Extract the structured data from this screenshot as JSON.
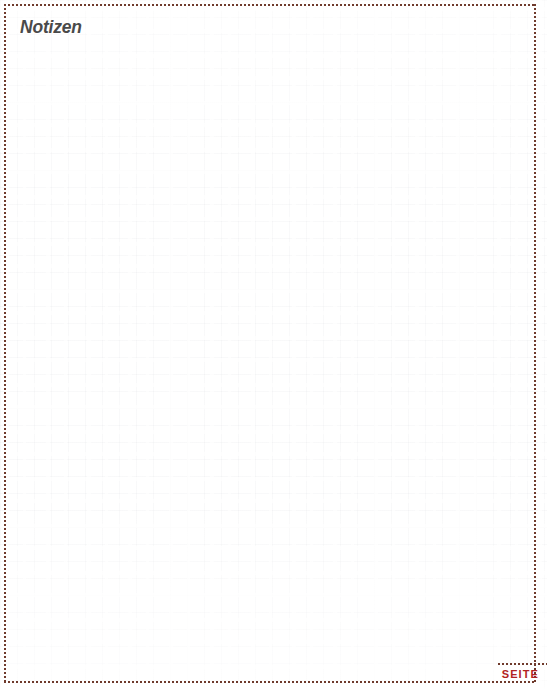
{
  "page": {
    "title": "Notizen",
    "language": "de",
    "width": 547,
    "height": 689,
    "background_color": "#ffffff"
  },
  "notes": {
    "heading": "Notizen",
    "body_text": "",
    "placeholder": "",
    "grid_style": "broken-graph-paper",
    "grid_cell_px": 17,
    "grid_line_color": "#787d8c"
  },
  "frame": {
    "style": "dotted",
    "color": "#6f3a2c",
    "dot_size_px": 2,
    "dot_gap_px": 2
  },
  "footer": {
    "seite_label": "SEITE",
    "page_number": "",
    "accent_color": "#b22222",
    "divider_color": "#6f3a2c"
  }
}
